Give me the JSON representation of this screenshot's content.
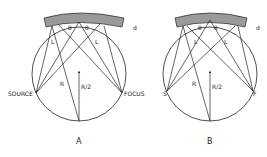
{
  "panels": [
    {
      "caption": "A",
      "labels": {
        "source": "SOURCE",
        "focus": "FOCUS",
        "radius": "R",
        "half_radius": "R/2",
        "path_length": "L",
        "angle": "θ",
        "thickness": "d"
      }
    },
    {
      "caption": "B",
      "labels": {
        "source": "S",
        "focus": "F",
        "radius": "R",
        "half_radius": "R/2",
        "path_length": "L",
        "angle": "θ",
        "thickness": "d"
      }
    }
  ],
  "colors": {
    "line": "#222222",
    "crystal": "#9a9a9a"
  }
}
